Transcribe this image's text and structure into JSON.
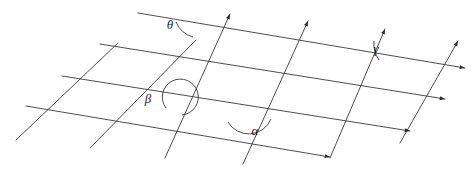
{
  "figure": {
    "background_color": "#ffffff",
    "line_color": "#3a3a3a",
    "label_color": "#1a1a1a",
    "width": 474,
    "height": 175
  },
  "angles": [
    {
      "id": "theta",
      "label": "θ",
      "label_x": 170,
      "label_y": 29,
      "kind": "acute",
      "description": "angle between top near-horizontal line and rising transversal",
      "vertex_x": 199,
      "vertex_y": 27,
      "arc": "M 176 22 A 26 26 0 0 0 193 37"
    },
    {
      "id": "gamma",
      "label": "γ",
      "label_x": 376,
      "label_y": 53,
      "kind": "acute",
      "description": "angle between second near-horizontal line and rising transversal at right",
      "vertex_x": 350,
      "vertex_y": 55,
      "arc": "M 374 41 A 28 28 0 0 0 379 60"
    },
    {
      "id": "beta",
      "label": "β",
      "label_x": 148,
      "label_y": 103,
      "kind": "reflex",
      "description": "reflex angle shown by an almost complete circle around an intersection",
      "vertex_x": 180,
      "vertex_y": 98,
      "arc": "M 166 108 A 18 18 0 1 1 182 115"
    },
    {
      "id": "alpha",
      "label": "α",
      "label_x": 255,
      "label_y": 135,
      "kind": "obtuse",
      "description": "obtuse angle below the intersection of a transversal and a near-horizontal line",
      "vertex_x": 248,
      "vertex_y": 111,
      "arc": "M 228 122 A 24 24 0 0 0 271 119"
    }
  ],
  "near_horizontal_lines": [
    {
      "id": "h1",
      "x1": 138,
      "y1": 13,
      "x2": 465,
      "y2": 68,
      "arrow": true
    },
    {
      "id": "h2",
      "x1": 100,
      "y1": 44,
      "x2": 445,
      "y2": 99,
      "arrow": true
    },
    {
      "id": "h3",
      "x1": 62,
      "y1": 76,
      "x2": 410,
      "y2": 131,
      "arrow": true
    },
    {
      "id": "h4",
      "x1": 26,
      "y1": 106,
      "x2": 330,
      "y2": 157,
      "arrow": true
    }
  ],
  "transversal_lines": [
    {
      "id": "t1",
      "x1": 16,
      "y1": 140,
      "x2": 118,
      "y2": 43,
      "arrow": false
    },
    {
      "id": "t2",
      "x1": 90,
      "y1": 148,
      "x2": 196,
      "y2": 40,
      "arrow": false
    },
    {
      "id": "t3",
      "x1": 165,
      "y1": 158,
      "x2": 230,
      "y2": 14,
      "arrow": true
    },
    {
      "id": "t4",
      "x1": 243,
      "y1": 164,
      "x2": 308,
      "y2": 21,
      "arrow": true
    },
    {
      "id": "t5",
      "x1": 330,
      "y1": 158,
      "x2": 385,
      "y2": 29,
      "arrow": true
    },
    {
      "id": "t6",
      "x1": 400,
      "y1": 143,
      "x2": 458,
      "y2": 41,
      "arrow": true
    }
  ],
  "arrow_endpoints": [
    {
      "id": "a-h1",
      "x": 465,
      "y": 68
    },
    {
      "id": "a-h2",
      "x": 445,
      "y": 99
    },
    {
      "id": "a-h3",
      "x": 410,
      "y": 131
    },
    {
      "id": "a-h4",
      "x": 330,
      "y": 157
    },
    {
      "id": "a-t3",
      "x": 230,
      "y": 14
    },
    {
      "id": "a-t4",
      "x": 308,
      "y": 21
    },
    {
      "id": "a-t5",
      "x": 385,
      "y": 29
    },
    {
      "id": "a-t6",
      "x": 458,
      "y": 41
    }
  ]
}
